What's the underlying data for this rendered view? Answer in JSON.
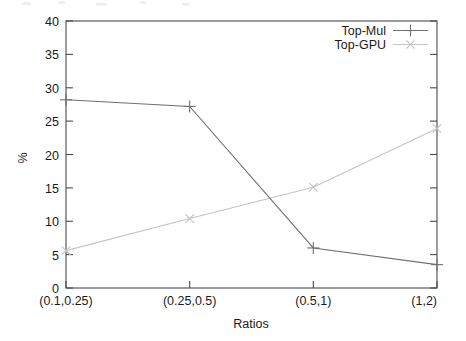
{
  "chart_data": {
    "type": "line",
    "title": "",
    "xlabel": "Ratios",
    "ylabel": "%",
    "categories": [
      "(0.1,0.25)",
      "(0.25,0.5)",
      "(0.5,1)",
      "(1,2)"
    ],
    "ylim": [
      0,
      40
    ],
    "yticks": [
      0,
      5,
      10,
      15,
      20,
      25,
      30,
      35,
      40
    ],
    "ytick_labels": [
      "0",
      "5",
      "10",
      "15",
      "20",
      "25",
      "30",
      "35",
      "40"
    ],
    "grid": false,
    "legend_position": "top-right-inside",
    "series": [
      {
        "name": "Top-Mul",
        "marker": "plus",
        "color": "#707070",
        "values": [
          28.2,
          27.2,
          6.0,
          3.5
        ]
      },
      {
        "name": "Top-GPU",
        "marker": "cross",
        "color": "#c4c4c4",
        "values": [
          5.6,
          10.4,
          15.1,
          23.9
        ]
      }
    ]
  },
  "axes": {
    "y_axis_label": "%",
    "x_axis_label": "Ratios"
  },
  "legend": {
    "entries": [
      {
        "label": "Top-Mul",
        "marker": "plus"
      },
      {
        "label": "Top-GPU",
        "marker": "cross"
      }
    ]
  },
  "colors": {
    "series_top_mul": "#707070",
    "series_top_gpu": "#c4c4c4",
    "axis": "#4a4a4a",
    "text": "#1a1a1a",
    "background": "#ffffff"
  }
}
